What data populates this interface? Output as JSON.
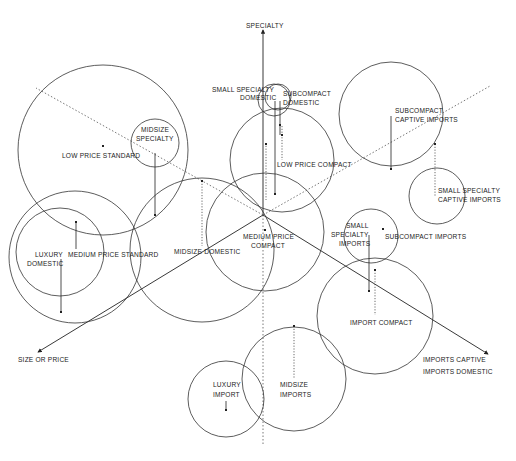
{
  "axes": [
    {
      "id": "specialty",
      "label": "SPECIALTY",
      "style": "solid"
    },
    {
      "id": "size-or-price",
      "label": "SIZE OR PRICE",
      "style": "solid"
    },
    {
      "id": "imports-captive",
      "label": "IMPORTS CAPTIVE",
      "style": "solid"
    },
    {
      "id": "imports-domestic",
      "label": "IMPORTS DOMESTIC",
      "style": "dotted"
    }
  ],
  "segments": [
    {
      "id": "low-price-standard",
      "label": [
        "LOW PRICE STANDARD"
      ]
    },
    {
      "id": "midsize-specialty",
      "label": [
        "MIDSIZE",
        "SPECIALTY"
      ]
    },
    {
      "id": "small-specialty-domestic",
      "label": [
        "SMALL SPECIALTY",
        "DOMESTIC"
      ]
    },
    {
      "id": "subcompact-domestic",
      "label": [
        "SUBCOMPACT",
        "DOMESTIC"
      ]
    },
    {
      "id": "low-price-compact",
      "label": [
        "LOW PRICE COMPACT"
      ]
    },
    {
      "id": "subcompact-captive-imports",
      "label": [
        "SUBCOMPACT",
        "CAPTIVE IMPORTS"
      ]
    },
    {
      "id": "small-specialty-captive-imports",
      "label": [
        "SMALL SPECIALTY",
        "CAPTIVE IMPORTS"
      ]
    },
    {
      "id": "luxury-domestic",
      "label": [
        "LUXURY",
        "DOMESTIC"
      ]
    },
    {
      "id": "medium-price-standard",
      "label": [
        "MEDIUM PRICE STANDARD"
      ]
    },
    {
      "id": "midsize-domestic",
      "label": [
        "MIDSIZE DOMESTIC"
      ]
    },
    {
      "id": "medium-price-compact",
      "label": [
        "MEDIUM PRICE",
        "COMPACT"
      ]
    },
    {
      "id": "small-specialty-imports",
      "label": [
        "SMALL",
        "SPECIALTY",
        "IMPORTS"
      ]
    },
    {
      "id": "subcompact-imports",
      "label": [
        "SUBCOMPACT IMPORTS"
      ]
    },
    {
      "id": "import-compact",
      "label": [
        "IMPORT COMPACT"
      ]
    },
    {
      "id": "luxury-import",
      "label": [
        "LUXURY",
        "IMPORT"
      ]
    },
    {
      "id": "midsize-imports",
      "label": [
        "MIDSIZE",
        "IMPORTS"
      ]
    }
  ]
}
